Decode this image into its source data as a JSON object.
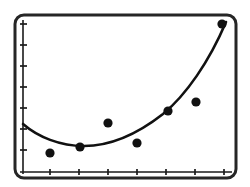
{
  "screen": {
    "name": "graphing-calculator-plot",
    "background_color": "#ffffff",
    "ink_color": "#1a1a1a"
  },
  "frame": {
    "label": "calculator-screen-bezel",
    "x": 15,
    "y": 15,
    "width": 221,
    "height": 163,
    "corner_radius": 9,
    "border_width": 3,
    "border_color": "#262626"
  },
  "chart_data": {
    "type": "scatter",
    "title": "",
    "subtitle": "",
    "xlabel": "",
    "ylabel": "",
    "grid": false,
    "legend": null,
    "axis_color": "#1a1a1a",
    "point_color": "#111111",
    "curve_color": "#111111",
    "point_radius": 4.6,
    "curve_width": 2.6,
    "axis_width": 1.6,
    "tick_length": 6,
    "xlim": [
      0,
      8
    ],
    "ylim": [
      0,
      8
    ],
    "x_axis_pixel_y": 172,
    "y_axis_pixel_x": 23,
    "x_tick_pixels": [
      50,
      79,
      108,
      137,
      166,
      195,
      224
    ],
    "y_tick_pixels": [
      24,
      45,
      66,
      87,
      108,
      129,
      150
    ],
    "x_tick_labels": [
      "",
      "",
      "",
      "",
      "",
      "",
      ""
    ],
    "y_tick_labels": [
      "",
      "",
      "",
      "",
      "",
      "",
      ""
    ],
    "points": [
      {
        "label": "P1",
        "x": 1,
        "y": 1.3,
        "px": 50,
        "py": 153
      },
      {
        "label": "P2",
        "x": 2,
        "y": 1.7,
        "px": 80,
        "py": 147
      },
      {
        "label": "P3",
        "x": 3,
        "y": 3.3,
        "px": 108,
        "py": 123
      },
      {
        "label": "P4",
        "x": 4,
        "y": 2.0,
        "px": 137,
        "py": 143
      },
      {
        "label": "P5",
        "x": 5,
        "y": 4.2,
        "px": 168,
        "py": 111
      },
      {
        "label": "P6",
        "x": 6,
        "y": 4.8,
        "px": 196,
        "py": 102
      },
      {
        "label": "P7",
        "x": 7,
        "y": 9.8,
        "px": 222,
        "py": 24
      }
    ],
    "fit": {
      "kind": "quadratic-regression-curve",
      "description": "U-shaped parabola minimum near left third, rising steeply to upper right",
      "vertex_px": [
        84,
        146
      ],
      "path": "M 23,124 C 38,137 60,146 84,146 C 112,146 140,132 163,114 C 186,95 209,62 226,22"
    }
  }
}
